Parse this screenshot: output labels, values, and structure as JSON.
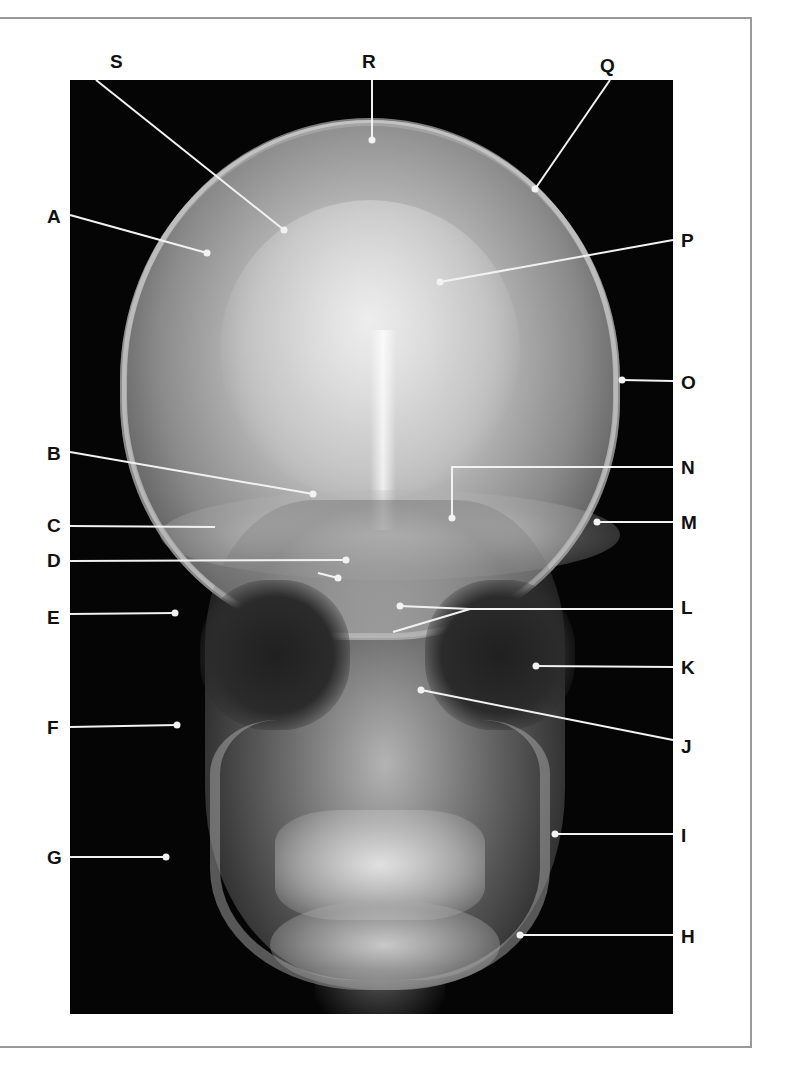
{
  "figure": {
    "type": "frontal skull radiograph (PA view)",
    "colors": {
      "background": "#ffffff",
      "frame": "#9a9a9a",
      "xray_bg": "#050505",
      "leader_line": "#f2f2f2",
      "label_text": "#111111"
    }
  },
  "labels": [
    {
      "id": "A",
      "text": "A",
      "x": 47,
      "y": 207
    },
    {
      "id": "B",
      "text": "B",
      "x": 47,
      "y": 444
    },
    {
      "id": "C",
      "text": "C",
      "x": 47,
      "y": 516
    },
    {
      "id": "D",
      "text": "D",
      "x": 47,
      "y": 551
    },
    {
      "id": "E",
      "text": "E",
      "x": 47,
      "y": 608
    },
    {
      "id": "F",
      "text": "F",
      "x": 47,
      "y": 718
    },
    {
      "id": "G",
      "text": "G",
      "x": 47,
      "y": 848
    },
    {
      "id": "H",
      "text": "H",
      "x": 681,
      "y": 927
    },
    {
      "id": "I",
      "text": "I",
      "x": 681,
      "y": 826
    },
    {
      "id": "J",
      "text": "J",
      "x": 681,
      "y": 737
    },
    {
      "id": "K",
      "text": "K",
      "x": 681,
      "y": 658
    },
    {
      "id": "L",
      "text": "L",
      "x": 681,
      "y": 598
    },
    {
      "id": "M",
      "text": "M",
      "x": 681,
      "y": 513
    },
    {
      "id": "N",
      "text": "N",
      "x": 681,
      "y": 458
    },
    {
      "id": "O",
      "text": "O",
      "x": 681,
      "y": 373
    },
    {
      "id": "P",
      "text": "P",
      "x": 681,
      "y": 231
    },
    {
      "id": "Q",
      "text": "Q",
      "x": 600,
      "y": 56
    },
    {
      "id": "R",
      "text": "R",
      "x": 362,
      "y": 52
    },
    {
      "id": "S",
      "text": "S",
      "x": 110,
      "y": 52
    }
  ],
  "leaders": [
    {
      "id": "A",
      "points": [
        [
          70,
          215
        ],
        [
          207,
          253
        ]
      ],
      "dot": [
        207,
        253
      ]
    },
    {
      "id": "B",
      "points": [
        [
          70,
          452
        ],
        [
          313,
          494
        ]
      ],
      "dot": [
        313,
        494
      ]
    },
    {
      "id": "C",
      "points": [
        [
          70,
          526
        ],
        [
          215,
          527
        ]
      ],
      "dot": null
    },
    {
      "id": "D1",
      "points": [
        [
          70,
          561
        ],
        [
          346,
          560
        ]
      ],
      "dot": [
        346,
        560
      ]
    },
    {
      "id": "D2",
      "points": [
        [
          318,
          573
        ],
        [
          338,
          578
        ]
      ],
      "dot": [
        338,
        578
      ]
    },
    {
      "id": "E",
      "points": [
        [
          70,
          614
        ],
        [
          175,
          613
        ]
      ],
      "dot": [
        175,
        613
      ]
    },
    {
      "id": "F",
      "points": [
        [
          70,
          727
        ],
        [
          177,
          725
        ]
      ],
      "dot": [
        177,
        725
      ]
    },
    {
      "id": "G",
      "points": [
        [
          70,
          857
        ],
        [
          166,
          857
        ]
      ],
      "dot": [
        166,
        857
      ]
    },
    {
      "id": "H",
      "points": [
        [
          673,
          935
        ],
        [
          520,
          935
        ]
      ],
      "dot": [
        520,
        935
      ]
    },
    {
      "id": "I",
      "points": [
        [
          673,
          834
        ],
        [
          555,
          834
        ]
      ],
      "dot": [
        555,
        834
      ]
    },
    {
      "id": "J",
      "points": [
        [
          673,
          740
        ],
        [
          421,
          690
        ]
      ],
      "dot": [
        421,
        690
      ]
    },
    {
      "id": "K",
      "points": [
        [
          673,
          667
        ],
        [
          536,
          666
        ]
      ],
      "dot": [
        536,
        666
      ]
    },
    {
      "id": "L1",
      "points": [
        [
          673,
          609
        ],
        [
          470,
          609
        ],
        [
          400,
          606
        ]
      ],
      "dot": [
        400,
        606
      ]
    },
    {
      "id": "L2",
      "points": [
        [
          470,
          609
        ],
        [
          393,
          632
        ]
      ],
      "dot": null
    },
    {
      "id": "M",
      "points": [
        [
          673,
          522
        ],
        [
          597,
          522
        ]
      ],
      "dot": [
        597,
        522
      ]
    },
    {
      "id": "N",
      "points": [
        [
          673,
          467
        ],
        [
          452,
          467
        ],
        [
          452,
          518
        ]
      ],
      "dot": [
        452,
        518
      ]
    },
    {
      "id": "O",
      "points": [
        [
          673,
          381
        ],
        [
          622,
          380
        ]
      ],
      "dot": [
        622,
        380
      ]
    },
    {
      "id": "P",
      "points": [
        [
          673,
          240
        ],
        [
          440,
          282
        ]
      ],
      "dot": [
        440,
        282
      ]
    },
    {
      "id": "Q",
      "points": [
        [
          610,
          80
        ],
        [
          535,
          189
        ]
      ],
      "dot": [
        535,
        189
      ]
    },
    {
      "id": "R",
      "points": [
        [
          372,
          80
        ],
        [
          372,
          140
        ]
      ],
      "dot": [
        372,
        140
      ]
    },
    {
      "id": "S",
      "points": [
        [
          96,
          80
        ],
        [
          284,
          230
        ]
      ],
      "dot": [
        284,
        230
      ]
    }
  ]
}
